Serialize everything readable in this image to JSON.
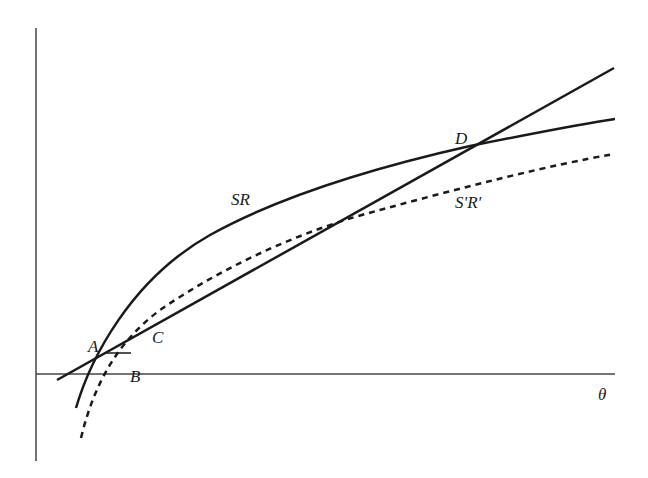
{
  "diagram": {
    "axes": {
      "x_label": "θ",
      "y_label": ""
    },
    "curves": [
      {
        "id": "SR",
        "label": "SR",
        "style": "solid"
      },
      {
        "id": "SpRp",
        "label": "S'R'",
        "style": "dashed"
      },
      {
        "id": "line",
        "label": "",
        "style": "solid"
      }
    ],
    "points": {
      "A": "A",
      "B": "B",
      "C": "C",
      "D": "D"
    },
    "colors": {
      "ink": "#1a1a1a",
      "axis": "#444444"
    }
  }
}
